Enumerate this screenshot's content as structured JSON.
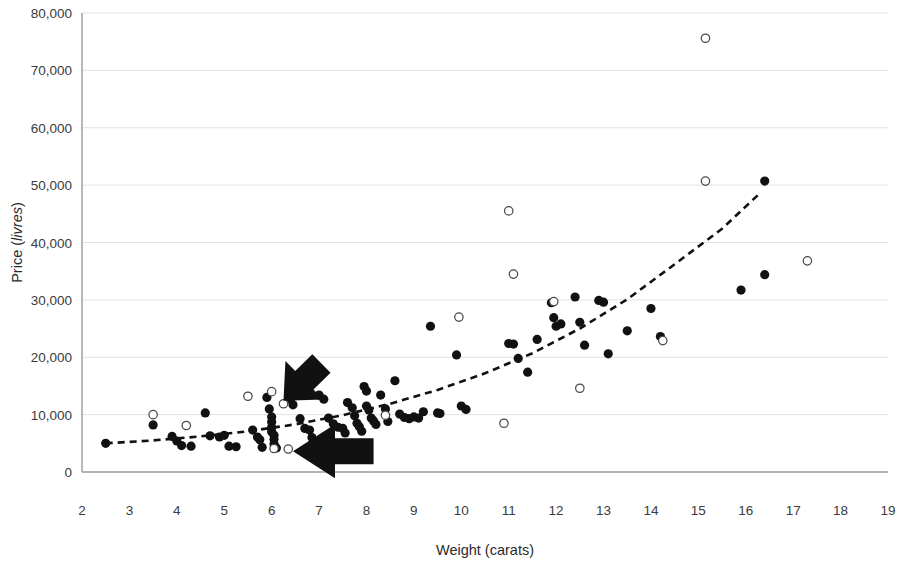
{
  "chart_data": {
    "type": "scatter",
    "title": "",
    "xlabel": "Weight (carats)",
    "ylabel": "Price (livres)",
    "ylabel_plain": "Price (",
    "ylabel_italic": "livres",
    "ylabel_tail": ")",
    "xlim": [
      2,
      19
    ],
    "ylim": [
      0,
      80000
    ],
    "xticks": [
      2,
      3,
      4,
      5,
      6,
      7,
      8,
      9,
      10,
      11,
      12,
      13,
      14,
      15,
      16,
      17,
      18,
      19
    ],
    "xtick_labels": [
      "2",
      "3",
      "4",
      "5",
      "6",
      "7",
      "8",
      "9",
      "10",
      "11",
      "12",
      "13",
      "14",
      "15",
      "16",
      "17",
      "18",
      "19"
    ],
    "yticks": [
      0,
      10000,
      20000,
      30000,
      40000,
      50000,
      60000,
      70000,
      80000
    ],
    "ytick_labels": [
      "0",
      "10,000",
      "20,000",
      "30,000",
      "40,000",
      "50,000",
      "60,000",
      "70,000",
      "80,000"
    ],
    "grid": "horizontal",
    "legend": "none",
    "colors": {
      "filled_marker": "#111111",
      "open_marker_stroke": "#4a4a4a",
      "open_marker_fill": "#ffffff",
      "gridline": "#e2e2e2",
      "axis": "#9a9a9a",
      "trendline": "#111111",
      "annotation_arrow": "#111111"
    },
    "series": [
      {
        "name": "filled",
        "marker": "filled-circle",
        "points": [
          [
            2.5,
            5000
          ],
          [
            3.5,
            8200
          ],
          [
            3.9,
            6200
          ],
          [
            4.0,
            5400
          ],
          [
            4.1,
            4600
          ],
          [
            4.3,
            4500
          ],
          [
            4.6,
            10300
          ],
          [
            4.7,
            6300
          ],
          [
            4.9,
            6100
          ],
          [
            5.0,
            6400
          ],
          [
            5.1,
            4500
          ],
          [
            5.25,
            4400
          ],
          [
            5.6,
            7300
          ],
          [
            5.7,
            6100
          ],
          [
            5.75,
            5600
          ],
          [
            5.8,
            4300
          ],
          [
            5.9,
            13000
          ],
          [
            5.95,
            11000
          ],
          [
            6.0,
            9600
          ],
          [
            6.0,
            8700
          ],
          [
            6.0,
            7800
          ],
          [
            6.0,
            7000
          ],
          [
            6.05,
            6400
          ],
          [
            6.05,
            5700
          ],
          [
            6.05,
            4900
          ],
          [
            6.1,
            4200
          ],
          [
            6.4,
            12700
          ],
          [
            6.45,
            11700
          ],
          [
            6.6,
            9300
          ],
          [
            6.7,
            7600
          ],
          [
            6.8,
            7300
          ],
          [
            6.85,
            6000
          ],
          [
            7.0,
            13400
          ],
          [
            7.1,
            12700
          ],
          [
            7.2,
            9400
          ],
          [
            7.3,
            8400
          ],
          [
            7.4,
            7800
          ],
          [
            7.5,
            7600
          ],
          [
            7.55,
            6800
          ],
          [
            7.6,
            12100
          ],
          [
            7.7,
            11200
          ],
          [
            7.75,
            9800
          ],
          [
            7.8,
            8500
          ],
          [
            7.85,
            7900
          ],
          [
            7.9,
            7100
          ],
          [
            7.95,
            14900
          ],
          [
            8.0,
            14100
          ],
          [
            8.0,
            11500
          ],
          [
            8.05,
            10800
          ],
          [
            8.1,
            9400
          ],
          [
            8.15,
            8900
          ],
          [
            8.2,
            8300
          ],
          [
            8.3,
            13400
          ],
          [
            8.4,
            11000
          ],
          [
            8.45,
            8800
          ],
          [
            8.6,
            15900
          ],
          [
            8.7,
            10100
          ],
          [
            8.8,
            9500
          ],
          [
            8.9,
            9300
          ],
          [
            9.0,
            9600
          ],
          [
            9.1,
            9400
          ],
          [
            9.2,
            10500
          ],
          [
            9.35,
            25400
          ],
          [
            9.5,
            10300
          ],
          [
            9.55,
            10200
          ],
          [
            9.9,
            20400
          ],
          [
            10.0,
            11500
          ],
          [
            10.1,
            10900
          ],
          [
            11.0,
            22400
          ],
          [
            11.1,
            22300
          ],
          [
            11.2,
            19800
          ],
          [
            11.4,
            17400
          ],
          [
            11.6,
            23100
          ],
          [
            11.9,
            29500
          ],
          [
            11.95,
            26900
          ],
          [
            12.0,
            25400
          ],
          [
            12.1,
            25800
          ],
          [
            12.4,
            30500
          ],
          [
            12.5,
            26100
          ],
          [
            12.6,
            22100
          ],
          [
            12.9,
            29900
          ],
          [
            13.0,
            29600
          ],
          [
            13.1,
            20600
          ],
          [
            13.5,
            24600
          ],
          [
            14.0,
            28500
          ],
          [
            14.2,
            23600
          ],
          [
            15.9,
            31700
          ],
          [
            16.4,
            50700
          ],
          [
            16.4,
            34400
          ]
        ]
      },
      {
        "name": "open",
        "marker": "open-circle",
        "points": [
          [
            3.5,
            10000
          ],
          [
            4.2,
            8100
          ],
          [
            5.5,
            13200
          ],
          [
            6.0,
            14000
          ],
          [
            6.25,
            11900
          ],
          [
            6.05,
            4100
          ],
          [
            6.35,
            4000
          ],
          [
            8.4,
            9900
          ],
          [
            9.95,
            27000
          ],
          [
            10.9,
            8500
          ],
          [
            11.0,
            45500
          ],
          [
            11.1,
            34500
          ],
          [
            11.95,
            29700
          ],
          [
            12.5,
            14600
          ],
          [
            14.25,
            22900
          ],
          [
            15.15,
            75600
          ],
          [
            15.15,
            50700
          ],
          [
            17.3,
            36800
          ]
        ]
      }
    ],
    "trendline": {
      "style": "dashed",
      "description": "exponential fit",
      "points": [
        [
          2.5,
          5000
        ],
        [
          3.5,
          5500
        ],
        [
          4.5,
          6200
        ],
        [
          5.5,
          7100
        ],
        [
          6.5,
          8300
        ],
        [
          7.5,
          9900
        ],
        [
          8.5,
          11900
        ],
        [
          9.5,
          14300
        ],
        [
          10.5,
          17200
        ],
        [
          11.5,
          20700
        ],
        [
          12.5,
          25000
        ],
        [
          13.5,
          30100
        ],
        [
          14.5,
          36200
        ],
        [
          15.5,
          42400
        ],
        [
          16.3,
          48600
        ]
      ]
    },
    "annotations": [
      {
        "name": "arrow-upper",
        "type": "arrow",
        "direction": "down-left",
        "tail": [
          7.05,
          18900
        ],
        "head": [
          6.25,
          12400
        ]
      },
      {
        "name": "arrow-lower",
        "type": "arrow",
        "direction": "left",
        "tail": [
          8.15,
          3600
        ],
        "head": [
          6.45,
          3600
        ]
      }
    ]
  }
}
